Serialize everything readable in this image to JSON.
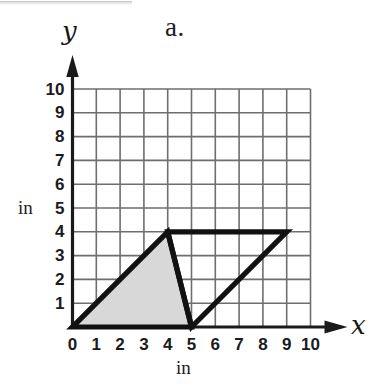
{
  "figure": {
    "label": "a.",
    "axis_x_name": "x",
    "axis_y_name": "y",
    "unit_label_x": "in",
    "unit_label_y": "in"
  },
  "colors": {
    "ink": "#1a1a1a",
    "grid": "#6e6e6e",
    "shape_stroke": "#111111",
    "shaded_fill": "#d8d8d8",
    "background": "#ffffff"
  },
  "chart_data": {
    "type": "scatter",
    "title": "a.",
    "xlabel": "in",
    "ylabel": "in",
    "xlim": [
      0,
      10
    ],
    "ylim": [
      0,
      10
    ],
    "grid": true,
    "grid_step": 1,
    "legend": "none",
    "x_ticks": [
      "0",
      "1",
      "2",
      "3",
      "4",
      "5",
      "6",
      "7",
      "8",
      "9",
      "10"
    ],
    "y_ticks": [
      "1",
      "2",
      "3",
      "4",
      "5",
      "6",
      "7",
      "8",
      "9",
      "10"
    ],
    "axis_arrows": [
      "x",
      "y"
    ],
    "shapes": [
      {
        "name": "shaded-triangle",
        "kind": "triangle",
        "vertices": [
          [
            0,
            0
          ],
          [
            5,
            0
          ],
          [
            4,
            4
          ]
        ],
        "filled": true,
        "fill": "#d8d8d8",
        "stroke": "#111111",
        "stroke_width_units": 0.22
      },
      {
        "name": "open-triangle",
        "kind": "triangle",
        "vertices": [
          [
            5,
            0
          ],
          [
            4,
            4
          ],
          [
            9,
            4
          ]
        ],
        "filled": false,
        "fill": "none",
        "stroke": "#111111",
        "stroke_width_units": 0.22
      }
    ]
  }
}
